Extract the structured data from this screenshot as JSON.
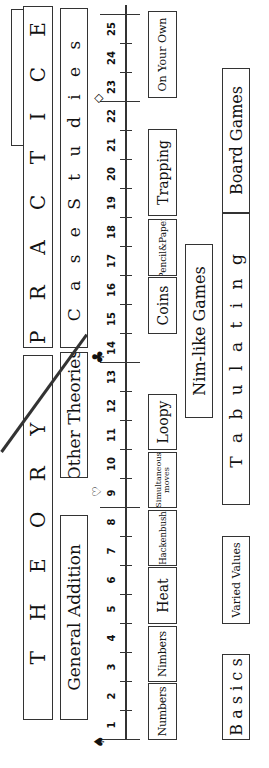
{
  "headers": {
    "theory": "T H E O R Y",
    "practice": "P R A C T I C E"
  },
  "row2": {
    "general_addition": "General Addition",
    "other_theories": "Other Theories",
    "case_studies": "C a s e   S t u d i e s"
  },
  "axis": {
    "ticks": [
      "1",
      "2",
      "3",
      "4",
      "5",
      "6",
      "7",
      "8",
      "9",
      "10",
      "11",
      "12",
      "13",
      "14",
      "15",
      "16",
      "17",
      "18",
      "19",
      "20",
      "21",
      "22",
      "23",
      "24",
      "25"
    ],
    "markers": {
      "start": "♠",
      "chapter9": "♡",
      "chapter14": "♣",
      "chapter23": "◇"
    }
  },
  "chapters": {
    "numbers": "Numbers",
    "nimbers": "Nimbers",
    "heat": "Heat",
    "hackenbush": "Hackenbush",
    "simultaneous_moves": "Simultaneous moves",
    "loopy": "Loopy",
    "coins": "Coins",
    "pencil_paper": "Pencil&Paper",
    "trapping": "Trapping",
    "on_your_own": "On Your Own"
  },
  "threads": {
    "nim_like_games": "Nim-like Games",
    "basics": "B a s i c s",
    "varied_values": "Varied Values",
    "tabulating": "T a b u l a t i n g",
    "board_games": "Board Games"
  }
}
